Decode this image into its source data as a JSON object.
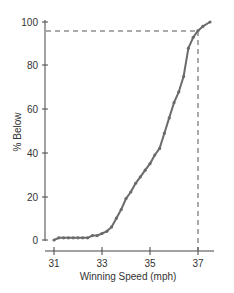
{
  "chart_data": {
    "type": "line",
    "title": "",
    "xlabel": "Winning Speed (mph)",
    "ylabel": "% Below",
    "xlim": [
      30.5,
      38
    ],
    "ylim": [
      0,
      100
    ],
    "x_ticks": [
      "31",
      "33",
      "35",
      "37"
    ],
    "y_ticks": [
      "0",
      "20",
      "40",
      "60",
      "80",
      "100"
    ],
    "grid": false,
    "legend": null,
    "series": [
      {
        "name": "Cumulative % Below",
        "x": [
          31.0,
          31.2,
          31.4,
          31.6,
          31.8,
          32.0,
          32.2,
          32.4,
          32.6,
          32.8,
          33.0,
          33.2,
          33.4,
          33.6,
          33.8,
          34.0,
          34.2,
          34.4,
          34.6,
          34.8,
          35.0,
          35.2,
          35.4,
          35.6,
          35.8,
          36.0,
          36.2,
          36.4,
          36.6,
          36.8,
          37.0,
          37.2,
          37.5
        ],
        "values": [
          0,
          1,
          1,
          1,
          1,
          1,
          1,
          1,
          2,
          2,
          3,
          4,
          6,
          10,
          14,
          19,
          22,
          26,
          29,
          32,
          35,
          39,
          42,
          49,
          56,
          63,
          68,
          75,
          88,
          93,
          96,
          98,
          100
        ]
      }
    ],
    "annotations": [
      {
        "type": "dashed-vline",
        "x": 37,
        "label": "37 mph"
      },
      {
        "type": "dashed-hline",
        "y": 96,
        "label": "96%"
      }
    ]
  },
  "axes": {
    "x_title": "Winning Speed (mph)",
    "y_title": "% Below",
    "x_ticks": [
      "31",
      "33",
      "35",
      "37"
    ],
    "y_ticks": [
      "0",
      "20",
      "40",
      "60",
      "80",
      "100"
    ]
  },
  "colors": {
    "line": "#6b6b6b",
    "axis": "#444444",
    "dash": "#555555"
  }
}
